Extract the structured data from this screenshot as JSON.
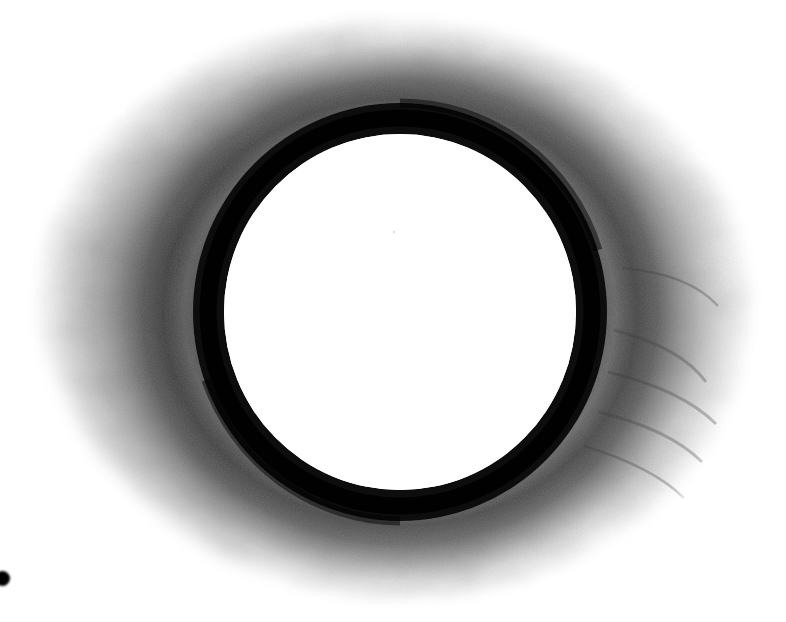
{
  "image": {
    "kind": "micrograph",
    "modality": "transmission-electron-micrograph",
    "subject": "circular-vesicle-cross-section",
    "width": 786,
    "height": 622,
    "background_color": "#ffffff",
    "colorspace": "grayscale",
    "caption_text": "",
    "scale_bar_text": "",
    "label_text": ""
  },
  "palette": {
    "background": "#ffffff",
    "lumen": "#ffffff",
    "membrane_dark": "#0a0a0a",
    "membrane_core": "#000000",
    "halo_dark": "#4a4a4a",
    "halo_mid": "#7d7d7d",
    "halo_light": "#bdbdbd",
    "halo_faint": "#e4e4e4",
    "fiducial": "#000000"
  },
  "structures": {
    "halo": {
      "name": "outer-diffuse-halo",
      "center_x": 392,
      "center_y": 310,
      "radius_x": 368,
      "radius_y": 300,
      "outer_extent": {
        "left": 28,
        "right": 762,
        "top": 16,
        "bottom": 606
      },
      "description": "grainy mottled grey corona fading to white toward the image corners"
    },
    "membrane": {
      "name": "dark-membrane-ring",
      "center_x": 400,
      "center_y": 312,
      "outer_radius_x": 207,
      "outer_radius_y": 209,
      "inner_radius_x": 176,
      "inner_radius_y": 178,
      "thickness_px": 31,
      "bounds": {
        "left": 196,
        "right": 608,
        "top": 103,
        "bottom": 521
      },
      "description": "sharp near-black annulus enclosing the lumen"
    },
    "lumen": {
      "name": "inner-white-lumen",
      "center_x": 400,
      "center_y": 312,
      "radius_x": 176,
      "radius_y": 178,
      "description": "electron-lucent empty interior, uniformly white"
    },
    "fiducial_dot": {
      "name": "fiducial-marker-dot",
      "x": 0,
      "y": 571,
      "diameter": 15,
      "clipped_at_left_edge": true,
      "description": "small solid black dot near the lower-left image border"
    }
  },
  "chart_data": {
    "type": "heatmap",
    "title": "",
    "xlabel": "",
    "ylabel": "",
    "grid": false,
    "legend": "none",
    "x": [
      0,
      40,
      80,
      120,
      160,
      176,
      190,
      200,
      212,
      224,
      232,
      250,
      280,
      320,
      360,
      400,
      440,
      480,
      520,
      560
    ],
    "xlabel_units": "radius in pixels from centre",
    "series": [
      {
        "name": "mean-gray-level",
        "values": [
          255,
          255,
          255,
          255,
          254,
          240,
          120,
          26,
          12,
          24,
          96,
          132,
          118,
          126,
          150,
          178,
          206,
          230,
          246,
          254
        ]
      }
    ],
    "ylim": [
      0,
      255
    ],
    "annotations": [
      {
        "label": "lumen",
        "range": [
          0,
          176
        ]
      },
      {
        "label": "membrane",
        "range": [
          176,
          232
        ]
      },
      {
        "label": "halo",
        "range": [
          232,
          560
        ]
      },
      {
        "label": "background",
        "range": [
          560,
          640
        ]
      }
    ]
  }
}
